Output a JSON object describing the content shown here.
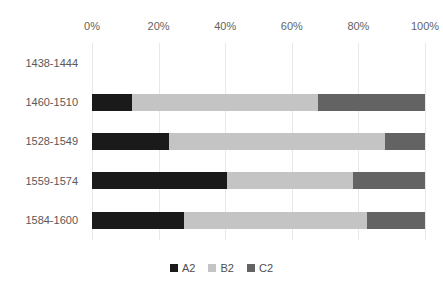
{
  "chart_data": {
    "type": "bar",
    "orientation": "horizontal",
    "stacked": true,
    "normalized": true,
    "title": "",
    "xlabel": "",
    "ylabel": "",
    "xlim": [
      0,
      100
    ],
    "grid": true,
    "legend_position": "bottom",
    "categories": [
      "1438-1444",
      "1460-1510",
      "1528-1549",
      "1559-1574",
      "1584-1600"
    ],
    "xticks": [
      {
        "value": 0,
        "label": "0%"
      },
      {
        "value": 20,
        "label": "20%"
      },
      {
        "value": 40,
        "label": "40%"
      },
      {
        "value": 60,
        "label": "60%"
      },
      {
        "value": 80,
        "label": "80%"
      },
      {
        "value": 100,
        "label": "100%"
      }
    ],
    "series": [
      {
        "name": "A2",
        "color": "#1a1a1a",
        "values": [
          null,
          12.0,
          23.0,
          40.5,
          27.5
        ]
      },
      {
        "name": "B2",
        "color": "#c4c4c4",
        "values": [
          null,
          56.0,
          65.0,
          38.0,
          55.0
        ]
      },
      {
        "name": "C2",
        "color": "#636363",
        "values": [
          null,
          32.0,
          12.0,
          21.5,
          17.5
        ]
      }
    ],
    "empty_categories": [
      "1438-1444"
    ]
  },
  "legend": {
    "items": [
      {
        "label": "A2",
        "key": "a2"
      },
      {
        "label": "B2",
        "key": "b2"
      },
      {
        "label": "C2",
        "key": "c2"
      }
    ]
  }
}
